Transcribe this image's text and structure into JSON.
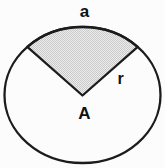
{
  "figure": {
    "labels": {
      "arc": "a",
      "radius": "r",
      "center": "A"
    },
    "colors": {
      "stroke": "#1c1c1c",
      "label": "#111111",
      "stipple_dark": "#c9c9c9",
      "stipple_light": "#ededed",
      "background": "#fcfcfc"
    }
  }
}
